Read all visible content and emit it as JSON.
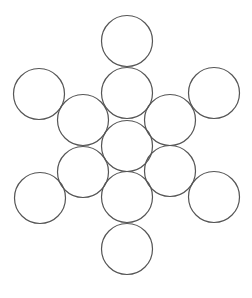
{
  "diagram": {
    "title": "",
    "width": 252,
    "height": 298,
    "background": "#ffffff",
    "stroke_color": "#555555",
    "stroke_width": 1.2,
    "fill": "none",
    "radius": 25.5,
    "circles": [
      {
        "id": "top",
        "cx": 127,
        "cy": 41
      },
      {
        "id": "upper-left",
        "cx": 39,
        "cy": 94
      },
      {
        "id": "upper-center",
        "cx": 127,
        "cy": 93
      },
      {
        "id": "upper-right",
        "cx": 214,
        "cy": 93
      },
      {
        "id": "mid-upper-left",
        "cx": 83,
        "cy": 120
      },
      {
        "id": "mid-upper-right",
        "cx": 170,
        "cy": 120
      },
      {
        "id": "center",
        "cx": 127,
        "cy": 146
      },
      {
        "id": "mid-lower-left",
        "cx": 83,
        "cy": 172
      },
      {
        "id": "mid-lower-right",
        "cx": 170,
        "cy": 171
      },
      {
        "id": "lower-center",
        "cx": 127,
        "cy": 197
      },
      {
        "id": "lower-left",
        "cx": 40,
        "cy": 198
      },
      {
        "id": "lower-right",
        "cx": 214,
        "cy": 197
      },
      {
        "id": "bottom",
        "cx": 127,
        "cy": 249
      }
    ]
  }
}
